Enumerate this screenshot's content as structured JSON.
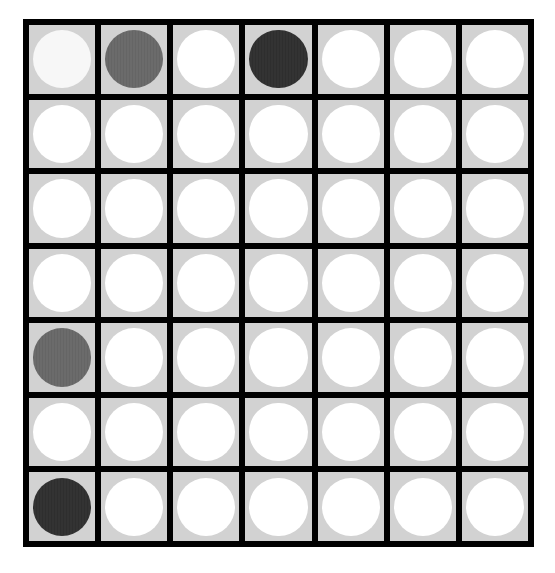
{
  "board": {
    "rows": 7,
    "cols": 7,
    "colors": {
      "grid": "#000000",
      "cell": "#d2d2d2",
      "empty": "#ffffff",
      "light": "#f7f7f7",
      "gray": "#6b6b6b",
      "dark": "#333333"
    },
    "cells": [
      [
        "light",
        "gray",
        "empty",
        "dark",
        "empty",
        "empty",
        "empty"
      ],
      [
        "empty",
        "empty",
        "empty",
        "empty",
        "empty",
        "empty",
        "empty"
      ],
      [
        "empty",
        "empty",
        "empty",
        "empty",
        "empty",
        "empty",
        "empty"
      ],
      [
        "empty",
        "empty",
        "empty",
        "empty",
        "empty",
        "empty",
        "empty"
      ],
      [
        "gray",
        "empty",
        "empty",
        "empty",
        "empty",
        "empty",
        "empty"
      ],
      [
        "empty",
        "empty",
        "empty",
        "empty",
        "empty",
        "empty",
        "empty"
      ],
      [
        "dark",
        "empty",
        "empty",
        "empty",
        "empty",
        "empty",
        "empty"
      ]
    ]
  }
}
